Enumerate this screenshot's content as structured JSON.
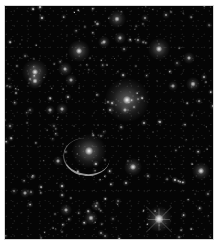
{
  "image": {
    "subject": "Galaxy cluster deep field with gravitational lensing arcs",
    "palette": {
      "background": "#050505",
      "margin": "#ffffff",
      "source": "#e8e8e8"
    },
    "features": {
      "bright_star": {
        "x": 154,
        "y": 213,
        "label": "foreground star with diffraction spikes"
      },
      "lensing_arc": {
        "x": 68,
        "y": 150,
        "label": "lensed arc"
      },
      "central_galaxy": {
        "x": 122,
        "y": 94,
        "label": "brightest cluster galaxy"
      }
    }
  }
}
